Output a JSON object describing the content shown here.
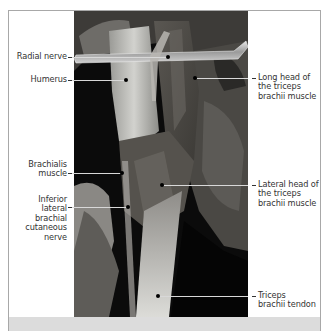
{
  "figure": {
    "photo_tone": "grayscale",
    "colors": {
      "frame_border": "#a8a8a8",
      "footer_strip": "#dcdcdc",
      "label_text": "#333333",
      "leader_line_on_photo": "#d8d8d8",
      "marker_dot": "#000000"
    }
  },
  "labels": {
    "left": [
      {
        "id": "radial-nerve",
        "lines": [
          "Radial nerve"
        ]
      },
      {
        "id": "humerus",
        "lines": [
          "Humerus"
        ]
      },
      {
        "id": "brachialis-muscle",
        "lines": [
          "Brachialis",
          "muscle"
        ]
      },
      {
        "id": "inferior-lateral-brachial-cutaneous-nerve",
        "lines": [
          "Inferior",
          "lateral",
          "brachial",
          "cutaneous",
          "nerve"
        ]
      }
    ],
    "right": [
      {
        "id": "long-head-triceps",
        "lines": [
          "Long head of",
          "the triceps",
          "brachii muscle"
        ]
      },
      {
        "id": "lateral-head-triceps",
        "lines": [
          "Lateral head of",
          "the triceps",
          "brachii muscle"
        ]
      },
      {
        "id": "triceps-tendon",
        "lines": [
          "Triceps",
          "brachii tendon"
        ]
      }
    ]
  }
}
